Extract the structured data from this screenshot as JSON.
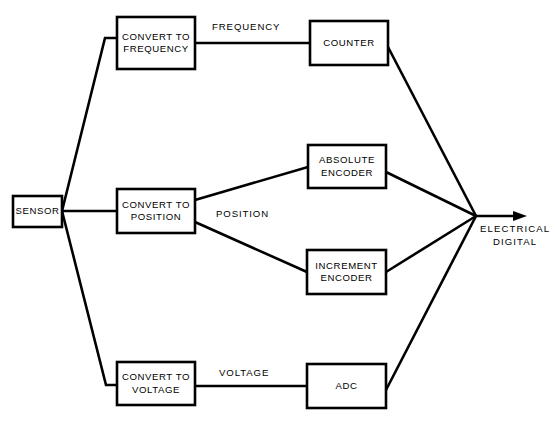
{
  "diagram": {
    "background_color": "#ffffff",
    "line_color": "#000000",
    "nodes": [
      {
        "id": "sensor",
        "label": "SENSOR",
        "x": 13,
        "y": 196,
        "w": 49,
        "h": 31
      },
      {
        "id": "convert-frequency",
        "label": "CONVERT TO\nFREQUENCY",
        "x": 117,
        "y": 17,
        "w": 78,
        "h": 52
      },
      {
        "id": "counter",
        "label": "COUNTER",
        "x": 310,
        "y": 21,
        "w": 78,
        "h": 44
      },
      {
        "id": "convert-position",
        "label": "CONVERT TO\nPOSITION",
        "x": 117,
        "y": 189,
        "w": 78,
        "h": 44
      },
      {
        "id": "absolute-encoder",
        "label": "ABSOLUTE\nENCODER",
        "x": 308,
        "y": 145,
        "w": 78,
        "h": 43
      },
      {
        "id": "increment-encoder",
        "label": "INCREMENT\nENCODER",
        "x": 307,
        "y": 250,
        "w": 79,
        "h": 44
      },
      {
        "id": "convert-voltage",
        "label": "CONVERT TO\nVOLTAGE",
        "x": 117,
        "y": 362,
        "w": 78,
        "h": 43
      },
      {
        "id": "adc",
        "label": "ADC",
        "x": 307,
        "y": 364,
        "w": 79,
        "h": 44
      }
    ],
    "edge_labels": [
      {
        "id": "frequency",
        "text": "FREQUENCY",
        "x": 212,
        "y": 21
      },
      {
        "id": "position",
        "text": "POSITION",
        "x": 216,
        "y": 208
      },
      {
        "id": "voltage",
        "text": "VOLTAGE",
        "x": 219,
        "y": 367
      }
    ],
    "output": {
      "id": "electrical-digital",
      "text": "ELECTRICAL\nDIGITAL",
      "x": 480,
      "y": 222,
      "converge_x": 476,
      "converge_y": 216,
      "arrow_tip_x": 527
    },
    "edges": [
      {
        "id": "sensor-to-frequency",
        "from": "sensor",
        "to": "convert-frequency"
      },
      {
        "id": "sensor-to-position",
        "from": "sensor",
        "to": "convert-position"
      },
      {
        "id": "sensor-to-voltage",
        "from": "sensor",
        "to": "convert-voltage"
      },
      {
        "id": "frequency-to-counter",
        "from": "convert-frequency",
        "to": "counter"
      },
      {
        "id": "position-to-absolute",
        "from": "convert-position",
        "to": "absolute-encoder"
      },
      {
        "id": "position-to-increment",
        "from": "convert-position",
        "to": "increment-encoder"
      },
      {
        "id": "voltage-to-adc",
        "from": "convert-voltage",
        "to": "adc"
      },
      {
        "id": "counter-to-output",
        "from": "counter",
        "to": "electrical-digital"
      },
      {
        "id": "absolute-encoder-to-output",
        "from": "absolute-encoder",
        "to": "electrical-digital"
      },
      {
        "id": "increment-encoder-to-output",
        "from": "increment-encoder",
        "to": "electrical-digital"
      },
      {
        "id": "adc-to-output",
        "from": "adc",
        "to": "electrical-digital"
      }
    ]
  }
}
